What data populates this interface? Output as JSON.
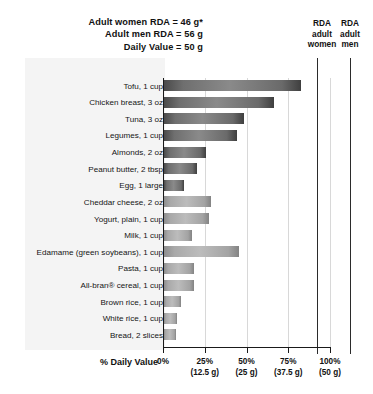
{
  "header": {
    "notes": [
      "Adult women RDA = 46 g*",
      "Adult men RDA = 56 g",
      "Daily Value = 50 g"
    ],
    "rda_women_caption": [
      "RDA",
      "adult",
      "women"
    ],
    "rda_men_caption": [
      "RDA",
      "adult",
      "men"
    ]
  },
  "axis": {
    "title": "% Daily Value",
    "ticks": [
      {
        "percent": "0%",
        "grams": ""
      },
      {
        "percent": "25%",
        "grams": "(12.5 g)"
      },
      {
        "percent": "50%",
        "grams": "(25 g)"
      },
      {
        "percent": "75%",
        "grams": "(37.5 g)"
      },
      {
        "percent": "100%",
        "grams": "(50 g)"
      }
    ]
  },
  "chart_data": {
    "type": "bar",
    "orientation": "horizontal",
    "title": "",
    "xlabel": "% Daily Value",
    "ylabel": "",
    "xlim": [
      0,
      100
    ],
    "grid": true,
    "categories": [
      "Tofu, 1 cup",
      "Chicken breast, 3 oz",
      "Tuna, 3 oz",
      "Legumes, 1 cup",
      "Almonds, 2 oz",
      "Peanut butter, 2 tbsp",
      "Egg, 1 large",
      "Cheddar cheese, 2 oz",
      "Yogurt, plain, 1 cup",
      "Milk, 1 cup",
      "Edamame (green soybeans), 1 cup",
      "Pasta, 1 cup",
      "All-bran® cereal, 1 cup",
      "Brown rice, 1 cup",
      "White rice, 1 cup",
      "Bread, 2 slices"
    ],
    "values": [
      82,
      66,
      48,
      44,
      25,
      20,
      12,
      28,
      27,
      17,
      45,
      18,
      18,
      10,
      8,
      7
    ],
    "group": [
      "animal-plant-high",
      "animal-plant-high",
      "animal-plant-high",
      "animal-plant-high",
      "animal-plant-high",
      "animal-plant-high",
      "animal-plant-high",
      "dairy",
      "dairy",
      "dairy",
      "plant",
      "plant",
      "plant",
      "plant",
      "plant",
      "plant"
    ],
    "reference_lines": [
      {
        "label": "RDA adult women",
        "percent": 92,
        "grams": 46
      },
      {
        "label": "RDA adult men",
        "percent": 112,
        "grams": 56
      }
    ],
    "colors": {
      "bar_dark": "#6f6f6f",
      "bar_light": "#aaaaaa",
      "axis": "#1a1a1a",
      "gridline": "#d8d8d8",
      "background": "#ffffff",
      "panel": "#f4f4f4"
    }
  }
}
